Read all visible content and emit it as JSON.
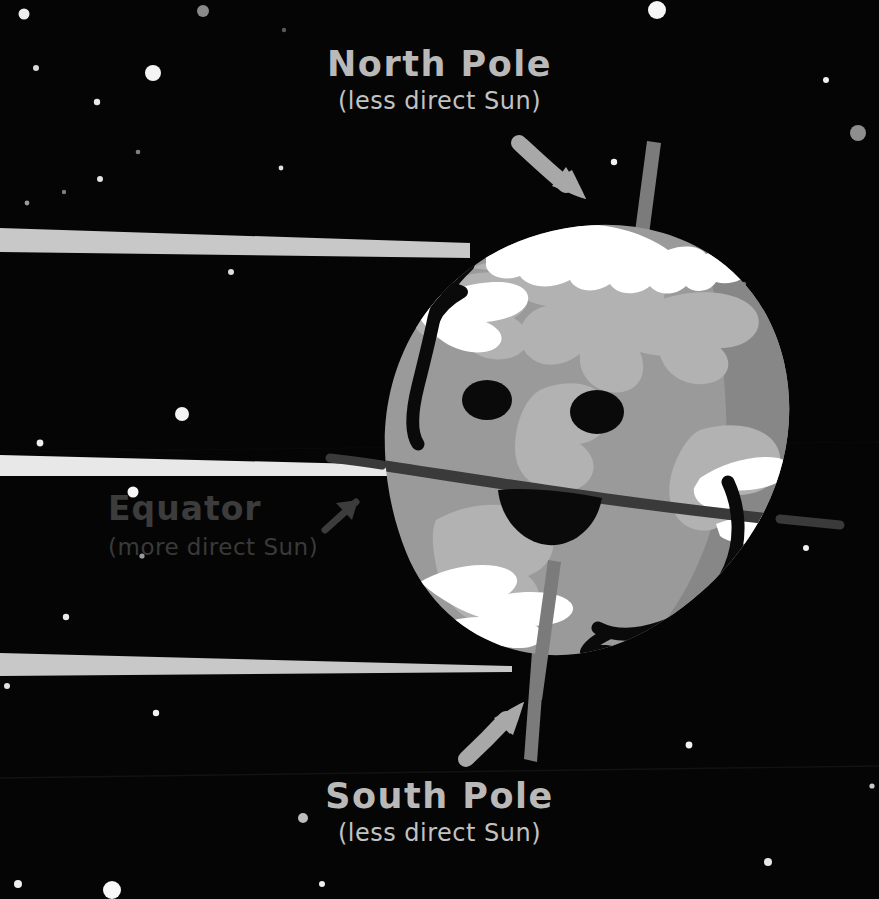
{
  "scene": {
    "title": "Earth axial tilt and sunlight angle diagram",
    "background_color": "#050505",
    "width": 879,
    "height": 899
  },
  "labels": {
    "north": {
      "title": "North Pole",
      "subtitle": "(less direct Sun)",
      "color": "#b9b9b9"
    },
    "south": {
      "title": "South Pole",
      "subtitle": "(less direct Sun)",
      "color": "#b9b9b9"
    },
    "equator": {
      "title": "Equator",
      "arrow_glyph": "↗",
      "subtitle": "(more direct Sun)",
      "color": "#3c3c3c"
    }
  },
  "planet": {
    "name": "earth-character",
    "base_color": "#9a9a9a",
    "shadow_color": "#868686",
    "land_color": "#b0b0b0",
    "ice_color": "#ffffff",
    "outline_color": "#000000",
    "expression": "smiling",
    "eyes": 2,
    "mouth": "open-smile",
    "arms": [
      "left-waving-hand",
      "right-waving-hand"
    ]
  },
  "axis": {
    "name": "rotation-axis",
    "color": "#7b7b7b",
    "tilted": true
  },
  "equator_line": {
    "color": "#3a3a3a"
  },
  "sun_rays": [
    {
      "name": "sun-ray-top",
      "color": "#c8c8c8"
    },
    {
      "name": "sun-ray-middle",
      "color": "#e8e8e8"
    },
    {
      "name": "sun-ray-bottom",
      "color": "#c8c8c8"
    }
  ],
  "arrows": [
    {
      "name": "north-pole-arrow",
      "color": "#a8a8a8",
      "direction": "down-right"
    },
    {
      "name": "south-pole-arrow",
      "color": "#a8a8a8",
      "direction": "up-right"
    }
  ],
  "stars": [
    {
      "cx": 24,
      "cy": 14,
      "r": 5.5,
      "c": "#eeeeee"
    },
    {
      "cx": 153,
      "cy": 73,
      "r": 8.0,
      "c": "#f4f4f4"
    },
    {
      "cx": 36,
      "cy": 68,
      "r": 3.0,
      "c": "#d9d9d9"
    },
    {
      "cx": 97,
      "cy": 102,
      "r": 3.2,
      "c": "#e8e8e8"
    },
    {
      "cx": 203,
      "cy": 11,
      "r": 6.0,
      "c": "#8a8a8a"
    },
    {
      "cx": 284,
      "cy": 30,
      "r": 2.2,
      "c": "#5a5a5a"
    },
    {
      "cx": 138,
      "cy": 152,
      "r": 2.3,
      "c": "#808080"
    },
    {
      "cx": 100,
      "cy": 179,
      "r": 3.0,
      "c": "#e4e4e4"
    },
    {
      "cx": 64,
      "cy": 192,
      "r": 2.2,
      "c": "#7e7e7e"
    },
    {
      "cx": 27,
      "cy": 203,
      "r": 2.4,
      "c": "#9a9a9a"
    },
    {
      "cx": 281,
      "cy": 168,
      "r": 2.4,
      "c": "#e0e0e0"
    },
    {
      "cx": 231,
      "cy": 272,
      "r": 3.0,
      "c": "#dddddd"
    },
    {
      "cx": 657,
      "cy": 10,
      "r": 9.0,
      "c": "#f6f6f6"
    },
    {
      "cx": 826,
      "cy": 80,
      "r": 3.0,
      "c": "#f0f0f0"
    },
    {
      "cx": 858,
      "cy": 133,
      "r": 8.0,
      "c": "#8e8e8e"
    },
    {
      "cx": 614,
      "cy": 162,
      "r": 3.2,
      "c": "#f2f2f2"
    },
    {
      "cx": 40,
      "cy": 443,
      "r": 3.4,
      "c": "#efefef"
    },
    {
      "cx": 182,
      "cy": 414,
      "r": 7.0,
      "c": "#f4f4f4"
    },
    {
      "cx": 133,
      "cy": 492,
      "r": 5.5,
      "c": "#f6f6f6"
    },
    {
      "cx": 142,
      "cy": 556,
      "r": 2.6,
      "c": "#9b9b9b"
    },
    {
      "cx": 66,
      "cy": 617,
      "r": 3.2,
      "c": "#eaeaea"
    },
    {
      "cx": 7,
      "cy": 686,
      "r": 3.0,
      "c": "#e2e2e2"
    },
    {
      "cx": 156,
      "cy": 713,
      "r": 3.2,
      "c": "#f2f2f2"
    },
    {
      "cx": 303,
      "cy": 818,
      "r": 5.0,
      "c": "#bdbdbd"
    },
    {
      "cx": 18,
      "cy": 884,
      "r": 4.0,
      "c": "#efefef"
    },
    {
      "cx": 112,
      "cy": 890,
      "r": 9.0,
      "c": "#f8f8f8"
    },
    {
      "cx": 322,
      "cy": 884,
      "r": 3.0,
      "c": "#eeeeee"
    },
    {
      "cx": 689,
      "cy": 745,
      "r": 3.4,
      "c": "#f2f2f2"
    },
    {
      "cx": 768,
      "cy": 862,
      "r": 4.0,
      "c": "#e6e6e6"
    },
    {
      "cx": 872,
      "cy": 786,
      "r": 2.6,
      "c": "#c9c9c9"
    },
    {
      "cx": 806,
      "cy": 548,
      "r": 3.0,
      "c": "#f0f0f0"
    },
    {
      "cx": 744,
      "cy": 284,
      "r": 2.2,
      "c": "#6e6e6e"
    },
    {
      "cx": 740,
      "cy": 290,
      "r": 2.0,
      "c": "#6a6a6a"
    }
  ]
}
